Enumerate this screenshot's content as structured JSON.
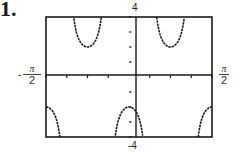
{
  "problem_number": "1.",
  "labels": {
    "y_max": "4",
    "y_min": "-4",
    "x_min": {
      "sign": "-",
      "numerator": "π",
      "denominator": "2"
    },
    "x_max": {
      "numerator": "π",
      "denominator": "2"
    }
  },
  "colors": {
    "curve": "#1a1a1a",
    "frame": "#1a1a1a",
    "background": "#ffffff"
  },
  "chart_data": {
    "type": "line",
    "title": "",
    "function_depicted": "y = -2 sec(4x)",
    "xlabel": "",
    "ylabel": "",
    "xlim": [
      -1.5708,
      1.5708
    ],
    "ylim": [
      -4,
      4
    ],
    "x_tick_labels": [
      "-π/2",
      "π/2"
    ],
    "y_tick_labels": [
      "4",
      "-4"
    ],
    "x_ticks_count_each_side": 4,
    "y_ticks_count_each_side": 4,
    "grid": false,
    "legend": null,
    "asymptotes_x": [
      -1.1781,
      -0.3927,
      0.3927,
      1.1781
    ],
    "key_points": [
      {
        "x": -1.5708,
        "y": -2
      },
      {
        "x": -0.7854,
        "y": 2
      },
      {
        "x": 0,
        "y": -2
      },
      {
        "x": 0.7854,
        "y": 2
      },
      {
        "x": 1.5708,
        "y": -2
      }
    ]
  }
}
